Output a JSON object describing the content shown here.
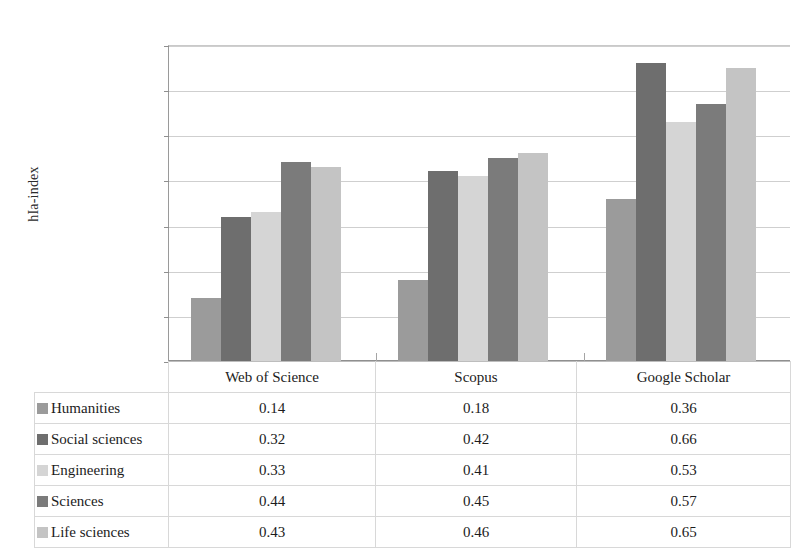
{
  "chart_data": {
    "type": "bar",
    "title": "",
    "xlabel": "",
    "ylabel": "hIa-index",
    "ylim": [
      0.0,
      0.7
    ],
    "ytick_labels": [
      "0.70",
      "0.60",
      "0.50",
      "0.40",
      "0.30",
      "0.20",
      "0.10",
      "0.0"
    ],
    "ytick_values": [
      0.7,
      0.6,
      0.5,
      0.4,
      0.3,
      0.2,
      0.1,
      0.0
    ],
    "grid": true,
    "legend_position": "table-left-column",
    "categories": [
      "Web of Science",
      "Scopus",
      "Google Scholar"
    ],
    "series": [
      {
        "name": "Humanities",
        "color": "#9b9b9b",
        "values": [
          0.14,
          0.18,
          0.36
        ]
      },
      {
        "name": "Social sciences",
        "color": "#6e6e6e",
        "values": [
          0.32,
          0.42,
          0.66
        ]
      },
      {
        "name": "Engineering",
        "color": "#d5d5d5",
        "values": [
          0.33,
          0.41,
          0.53
        ]
      },
      {
        "name": "Sciences",
        "color": "#7b7b7b",
        "values": [
          0.44,
          0.45,
          0.57
        ]
      },
      {
        "name": "Life sciences",
        "color": "#c4c4c4",
        "values": [
          0.43,
          0.46,
          0.65
        ]
      }
    ],
    "data_table": {
      "row_header_column": "",
      "columns": [
        "Web of Science",
        "Scopus",
        "Google Scholar"
      ],
      "rows": [
        {
          "label": "Humanities",
          "values": [
            "0.14",
            "0.18",
            "0.36"
          ]
        },
        {
          "label": "Social sciences",
          "values": [
            "0.32",
            "0.42",
            "0.66"
          ]
        },
        {
          "label": "Engineering",
          "values": [
            "0.33",
            "0.41",
            "0.53"
          ]
        },
        {
          "label": "Sciences",
          "values": [
            "0.44",
            "0.45",
            "0.57"
          ]
        },
        {
          "label": "Life sciences",
          "values": [
            "0.43",
            "0.46",
            "0.65"
          ]
        }
      ]
    }
  }
}
